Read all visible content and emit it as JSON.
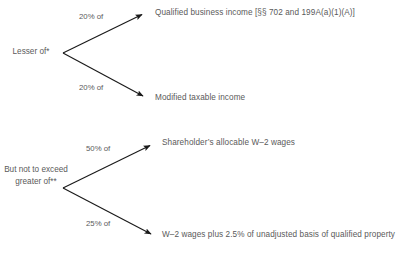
{
  "diagram": {
    "background_color": "#ffffff",
    "text_color": "#5a5a5a",
    "arrow_color": "#1a1a1a",
    "groups": [
      {
        "id": "lesser-of-group",
        "source_label": "Lesser of*",
        "branches": [
          {
            "edge_label": "20% of",
            "target_label": "Qualified business income [§§ 702 and 199A(a)(1)(A)]"
          },
          {
            "edge_label": "20% of",
            "target_label": "Modified taxable income"
          }
        ]
      },
      {
        "id": "but-not-to-exceed-group",
        "source_label": "But not to exceed greater of**",
        "source_label_lines": [
          "But not to",
          "exceed",
          "greater of**"
        ],
        "branches": [
          {
            "edge_label": "50% of",
            "target_label": "Shareholder’s allocable W–2 wages"
          },
          {
            "edge_label": "25% of",
            "target_label": "W–2 wages plus 2.5% of unadjusted basis of qualified property"
          }
        ]
      }
    ]
  }
}
